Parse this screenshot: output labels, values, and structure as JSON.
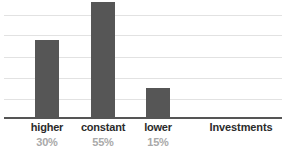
{
  "chart_data": {
    "type": "bar",
    "title": "",
    "subtitle": "",
    "xlabel": "Investments",
    "ylabel": "",
    "categories": [
      "higher",
      "constant",
      "lower"
    ],
    "values": [
      30,
      55,
      15
    ],
    "value_labels": [
      "30%",
      "55%",
      "15%"
    ],
    "series": [
      {
        "name": "Investments",
        "values": [
          30,
          55,
          15
        ],
        "color": "#565656"
      }
    ],
    "ylim": [
      0,
      58
    ],
    "grid": true,
    "gridline_count": 5,
    "legend": false,
    "legend_position": "none",
    "annotations": []
  },
  "axis": {
    "baseline_color": "#555555",
    "gridline_color": "#e2e2e2"
  },
  "colors": {
    "bar_fill": "#565656",
    "category_text": "#2b2b2b",
    "percent_text": "#a9a9a9",
    "background": "#ffffff"
  },
  "bars": [
    {
      "label": "higher",
      "percent": "30%",
      "left": 35,
      "top": 40,
      "height": 78
    },
    {
      "label": "constant",
      "percent": "55%",
      "left": 91,
      "top": 2,
      "height": 116
    },
    {
      "label": "lower",
      "percent": "15%",
      "left": 146,
      "top": 88,
      "height": 30
    }
  ],
  "gridlines": [
    {
      "top": 15
    },
    {
      "top": 35
    },
    {
      "top": 57
    },
    {
      "top": 78
    },
    {
      "top": 99
    }
  ],
  "labels": {
    "categories": [
      {
        "text": "higher",
        "left": 17,
        "width": 60
      },
      {
        "text": "constant",
        "left": 73,
        "width": 60
      },
      {
        "text": "lower",
        "left": 128,
        "width": 60
      }
    ],
    "percents": [
      {
        "text": "30%",
        "left": 17,
        "width": 60
      },
      {
        "text": "55%",
        "left": 73,
        "width": 60
      },
      {
        "text": "15%",
        "left": 128,
        "width": 60
      }
    ],
    "axis_title": {
      "text": "Investments",
      "left": 196,
      "width": 90
    }
  }
}
